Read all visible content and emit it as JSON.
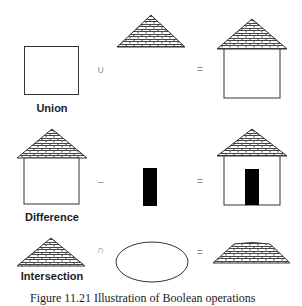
{
  "rows": [
    {
      "name": "union",
      "label": "Union",
      "operator": "∪",
      "equals": "=",
      "operand_a": "square",
      "operand_b": "roof-triangle",
      "result": "house"
    },
    {
      "name": "difference",
      "label": "Difference",
      "operator": "–",
      "equals": "=",
      "operand_a": "house",
      "operand_b": "black-door-rectangle",
      "result": "house-with-door"
    },
    {
      "name": "intersection",
      "label": "Intersection",
      "operator": "∩",
      "equals": "=",
      "operand_a": "roof-triangle",
      "operand_b": "ellipse",
      "result": "truncated-roof"
    }
  ],
  "caption": "Figure 11.21   Illustration of Boolean operations",
  "colors": {
    "stroke": "#333333",
    "fill": "#000000",
    "background": "#ffffff",
    "operator": "#888888"
  }
}
